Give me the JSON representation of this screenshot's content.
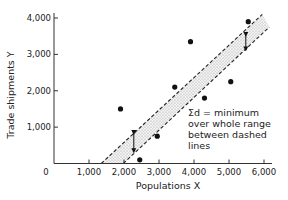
{
  "chart_data": {
    "type": "scatter",
    "title": "",
    "xlabel": "Populations X",
    "ylabel": "Trade shipments Y",
    "xlim": [
      0,
      6200
    ],
    "ylim": [
      0,
      4200
    ],
    "x_ticks": [
      0,
      1000,
      2000,
      3000,
      4000,
      5000,
      6000
    ],
    "x_tick_labels": [
      "0",
      "1,000",
      "2,000",
      "3,000",
      "4,000",
      "5,000",
      "6,000"
    ],
    "y_ticks": [
      1000,
      2000,
      3000,
      4000
    ],
    "y_tick_labels": [
      "1,000",
      "2,000",
      "3,000",
      "4,000"
    ],
    "grid": false,
    "series": [
      {
        "name": "observations",
        "points": [
          {
            "x": 1900,
            "y": 1500
          },
          {
            "x": 2450,
            "y": 100
          },
          {
            "x": 2950,
            "y": 750
          },
          {
            "x": 3450,
            "y": 2100
          },
          {
            "x": 3900,
            "y": 3350
          },
          {
            "x": 4300,
            "y": 1800
          },
          {
            "x": 5050,
            "y": 2250
          },
          {
            "x": 5550,
            "y": 3900
          }
        ]
      }
    ],
    "band": {
      "description": "shaded band between two parallel dashed lines",
      "upper_line": [
        {
          "x": 1350,
          "y": 0
        },
        {
          "x": 5950,
          "y": 4100
        }
      ],
      "lower_line": [
        {
          "x": 1980,
          "y": 0
        },
        {
          "x": 6150,
          "y": 3750
        }
      ]
    },
    "arrows": [
      {
        "x": 2280,
        "y_from": 850,
        "y_to": 350
      },
      {
        "x": 5480,
        "y_from": 3550,
        "y_to": 3150
      }
    ],
    "annotation": {
      "lines": [
        "Σd = minimum",
        "over whole range",
        "between dashed",
        "lines"
      ]
    }
  }
}
